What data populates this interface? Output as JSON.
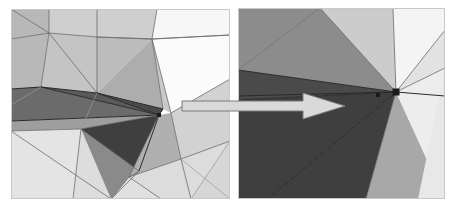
{
  "figure": {
    "caption": "",
    "background_color": "#ffffff",
    "width": 461,
    "height": 212
  },
  "panels": [
    {
      "id": "overview",
      "name": "overview-panel",
      "label": "",
      "x": 11,
      "y": 9,
      "width": 219,
      "height": 190,
      "background": "#ffffff"
    },
    {
      "id": "detail",
      "name": "detail-panel",
      "label": "",
      "x": 238,
      "y": 8,
      "width": 207,
      "height": 191,
      "background": "#ffffff"
    }
  ],
  "palette": {
    "very_dark": "#3f3f3f",
    "dark": "#4e4e4e",
    "mid_dark": "#8c8c8c",
    "mid": "#a3a3a3",
    "mid_light": "#b8b8b8",
    "light": "#cfcfcf",
    "lighter": "#dcdcdc",
    "lightest": "#e8e8e8",
    "near_white": "#f2f2f2",
    "white": "#ffffff",
    "edge": "#6b6b6b",
    "edge_dark": "#2a2a2a",
    "arrow_fill": "#d9d9d9",
    "arrow_stroke": "#7a7a7a",
    "vertex_marker": "#1a1a1a"
  },
  "arrow": {
    "name": "zoom-indicator-arrow",
    "description": "arrow pointing from overview panel to detail panel",
    "direction": "right",
    "tail_x": 182,
    "tip_x": 345,
    "center_y": 106,
    "shaft_half_height": 5,
    "head_half_height": 13,
    "head_length": 42,
    "fill": "#d9d9d9",
    "stroke": "#7a7a7a"
  },
  "mesh_overview": {
    "name": "triangulated-mesh-overview",
    "vertex_markers": [
      {
        "x": 148,
        "y": 106,
        "size": 4
      }
    ],
    "faces": [
      {
        "name": "face-tl-a",
        "points": "0,0 38,0 38,24 0,30",
        "fill": "#b8b8b8"
      },
      {
        "name": "face-tl-b",
        "points": "0,30 38,24 30,78 0,80",
        "fill": "#b8b8b8"
      },
      {
        "name": "face-tl-c",
        "points": "38,0 86,0 86,28 38,24",
        "fill": "#cfcfcf"
      },
      {
        "name": "face-tl-d",
        "points": "38,24 86,28 86,84 30,78",
        "fill": "#c4c4c4"
      },
      {
        "name": "face-tc-a",
        "points": "86,0 146,0 141,30 86,28",
        "fill": "#cfcfcf"
      },
      {
        "name": "face-tc-b",
        "points": "86,28 141,30 86,84",
        "fill": "#bcbcbc"
      },
      {
        "name": "face-tc-c",
        "points": "141,30 152,100 86,84",
        "fill": "#adadad"
      },
      {
        "name": "face-tr-a",
        "points": "146,0 219,0 219,26 141,30",
        "fill": "#f7f7f7"
      },
      {
        "name": "face-tr-b",
        "points": "141,30 219,26 219,70 160,104",
        "fill": "#fbfbfb"
      },
      {
        "name": "face-tr-c",
        "points": "141,30 160,104 152,100",
        "fill": "#c9c9c9"
      },
      {
        "name": "face-ml-a",
        "points": "0,80 30,78 10,96 0,96",
        "fill": "#a0a0a0"
      },
      {
        "name": "face-ml-b",
        "points": "0,80 10,96 0,96",
        "fill": "#8f8f8f"
      },
      {
        "name": "face-ml-c",
        "points": "0,80 30,78 148,106 0,112",
        "fill": "#6b6b6b"
      },
      {
        "name": "face-mc-a",
        "points": "30,78 86,84 148,106",
        "fill": "#5a5a5a"
      },
      {
        "name": "face-mc-b",
        "points": "86,84 152,100 148,106",
        "fill": "#4a4a4a"
      },
      {
        "name": "face-mc-c",
        "points": "0,112 148,106 70,120 0,122",
        "fill": "#9e9e9e"
      },
      {
        "name": "face-bl-a",
        "points": "0,122 70,120 62,190 0,190",
        "fill": "#e4e4e4"
      },
      {
        "name": "face-bl-b",
        "points": "70,120 100,190 62,190",
        "fill": "#dddddd"
      },
      {
        "name": "face-bc-a",
        "points": "70,120 148,106 118,168 100,190",
        "fill": "#8a8a8a"
      },
      {
        "name": "face-bc-b",
        "points": "148,106 128,162 118,168",
        "fill": "#4a4a4a"
      },
      {
        "name": "face-bc-c",
        "points": "70,120 148,106 128,162",
        "fill": "#3f3f3f"
      },
      {
        "name": "face-bc-d",
        "points": "100,190 118,168 150,190",
        "fill": "#e0e0e0"
      },
      {
        "name": "face-br-a",
        "points": "148,106 160,104 170,150 118,168",
        "fill": "#b0b0b0"
      },
      {
        "name": "face-br-b",
        "points": "118,168 170,150 180,190 150,190",
        "fill": "#dcdcdc"
      },
      {
        "name": "face-br-c",
        "points": "160,104 219,70 219,132 170,150",
        "fill": "#d2d2d2"
      },
      {
        "name": "face-br-d",
        "points": "170,150 219,132 219,190 180,190",
        "fill": "#dcdcdc"
      },
      {
        "name": "face-r-e",
        "points": "219,132 219,190 180,190",
        "fill": "#d6d6d6"
      }
    ],
    "edges": [
      {
        "name": "edge-top-curve",
        "d": "M 0,30 L 38,24 L 86,28 L 141,30 L 219,26",
        "class": "mesh-edge"
      },
      {
        "name": "edge-v1",
        "d": "M 38,0 L 38,24 L 30,78",
        "class": "mesh-edge"
      },
      {
        "name": "edge-v2",
        "d": "M 86,0 L 86,28 L 86,84",
        "class": "mesh-edge"
      },
      {
        "name": "edge-v3",
        "d": "M 146,0 L 141,30 L 152,100",
        "class": "mesh-edge"
      },
      {
        "name": "edge-d1",
        "d": "M 0,0 L 38,24",
        "class": "mesh-edge"
      },
      {
        "name": "edge-d2",
        "d": "M 38,24 L 86,84",
        "class": "mesh-edge"
      },
      {
        "name": "edge-d3",
        "d": "M 86,28 L 141,30",
        "class": "mesh-edge"
      },
      {
        "name": "edge-d4",
        "d": "M 141,30 L 160,104",
        "class": "mesh-edge"
      },
      {
        "name": "edge-d5",
        "d": "M 219,26 L 141,30",
        "class": "mesh-edge"
      },
      {
        "name": "edge-d6",
        "d": "M 219,70 L 160,104",
        "class": "mesh-edge"
      },
      {
        "name": "edge-h1",
        "d": "M 0,80 L 30,78 L 86,84 L 152,100 L 148,106",
        "class": "mesh-edge-dark"
      },
      {
        "name": "edge-h2",
        "d": "M 0,112 L 148,106",
        "class": "mesh-edge-dark"
      },
      {
        "name": "edge-h3",
        "d": "M 0,122 L 70,120 L 148,106",
        "class": "mesh-edge"
      },
      {
        "name": "edge-f1",
        "d": "M 30,78 L 148,106",
        "class": "mesh-edge-dark"
      },
      {
        "name": "edge-f2",
        "d": "M 86,84 L 148,106",
        "class": "mesh-edge-dark"
      },
      {
        "name": "edge-b1",
        "d": "M 70,120 L 128,162 L 118,168 L 100,190",
        "class": "mesh-edge"
      },
      {
        "name": "edge-b2",
        "d": "M 148,106 L 128,162",
        "class": "mesh-edge-dark"
      },
      {
        "name": "edge-b3",
        "d": "M 148,106 L 118,168",
        "class": "mesh-edge"
      },
      {
        "name": "edge-b4",
        "d": "M 118,168 L 150,190",
        "class": "mesh-edge"
      },
      {
        "name": "edge-b5",
        "d": "M 118,168 L 170,150",
        "class": "mesh-edge"
      },
      {
        "name": "edge-b6",
        "d": "M 160,104 L 170,150",
        "class": "mesh-edge"
      },
      {
        "name": "edge-b7",
        "d": "M 170,150 L 180,190",
        "class": "mesh-edge"
      },
      {
        "name": "edge-b8",
        "d": "M 170,150 L 219,132",
        "class": "mesh-edge"
      },
      {
        "name": "edge-b9",
        "d": "M 219,190 L 170,150",
        "class": "mesh-edge-faint"
      },
      {
        "name": "edge-b10",
        "d": "M 62,190 L 70,120",
        "class": "mesh-edge"
      },
      {
        "name": "edge-b11",
        "d": "M 0,122 L 100,190",
        "class": "mesh-edge"
      },
      {
        "name": "edge-b12",
        "d": "M 100,190 L 128,162",
        "class": "mesh-edge"
      },
      {
        "name": "edge-b13",
        "d": "M 86,84 L 70,120",
        "class": "mesh-edge-faint"
      },
      {
        "name": "edge-b14",
        "d": "M 0,96 L 30,78",
        "class": "mesh-edge-faint"
      },
      {
        "name": "edge-r1",
        "d": "M 219,132 L 180,190",
        "class": "mesh-edge-faint"
      }
    ]
  },
  "mesh_detail": {
    "name": "triangulated-mesh-detail",
    "vertex_markers": [
      {
        "x": 158,
        "y": 84,
        "size": 7
      },
      {
        "x": 140,
        "y": 87,
        "size": 4
      }
    ],
    "faces": [
      {
        "name": "d-face-upper-left",
        "points": "0,0 82,0 0,62",
        "fill": "#8c8c8c"
      },
      {
        "name": "d-face-upper-wedge",
        "points": "82,0 155,0 158,84 0,62",
        "fill": "#8c8c8c"
      },
      {
        "name": "d-face-upper-light",
        "points": "82,0 155,0 158,84",
        "fill": "#cccccc"
      },
      {
        "name": "d-face-top-right",
        "points": "155,0 207,0 207,22 158,84",
        "fill": "#f4f4f4"
      },
      {
        "name": "d-face-right-wedge-a",
        "points": "207,22 207,60 158,84",
        "fill": "#e2e2e2"
      },
      {
        "name": "d-face-band",
        "points": "0,62 158,84 0,92",
        "fill": "#4a4a4a"
      },
      {
        "name": "d-face-lower-left",
        "points": "0,92 158,84 30,191 0,191",
        "fill": "#3f3f3f"
      },
      {
        "name": "d-face-lower-mid",
        "points": "30,191 158,84 128,191",
        "fill": "#3f3f3f"
      },
      {
        "name": "d-face-lower-cone",
        "points": "158,84 128,191 207,191",
        "fill": "#a8a8a8"
      },
      {
        "name": "d-face-right-lower",
        "points": "158,84 207,60 207,191",
        "fill": "#ededed"
      },
      {
        "name": "d-face-right-strip",
        "points": "207,60 207,191 180,191",
        "fill": "#e8e8e8"
      }
    ],
    "edges": [
      {
        "name": "d-edge-1",
        "d": "M 0,0 L 0,62",
        "class": "mesh-edge-faint"
      },
      {
        "name": "d-edge-2",
        "d": "M 82,0 L 0,62",
        "class": "mesh-edge"
      },
      {
        "name": "d-edge-3",
        "d": "M 155,0 L 158,84",
        "class": "mesh-edge"
      },
      {
        "name": "d-edge-4",
        "d": "M 82,0 L 158,84",
        "class": "mesh-edge"
      },
      {
        "name": "d-edge-5",
        "d": "M 0,62 L 158,84",
        "class": "mesh-edge-dark"
      },
      {
        "name": "d-edge-6",
        "d": "M 0,92 L 158,84",
        "class": "mesh-edge-dark"
      },
      {
        "name": "d-edge-7",
        "d": "M 30,191 L 158,84",
        "class": "mesh-edge-dark"
      },
      {
        "name": "d-edge-8",
        "d": "M 128,191 L 158,84",
        "class": "mesh-edge"
      },
      {
        "name": "d-edge-9",
        "d": "M 158,84 L 207,22",
        "class": "mesh-edge"
      },
      {
        "name": "d-edge-10",
        "d": "M 158,84 L 207,60",
        "class": "mesh-edge"
      },
      {
        "name": "d-edge-11",
        "d": "M 158,84 L 207,88",
        "class": "mesh-edge-dark"
      },
      {
        "name": "d-edge-12",
        "d": "M 0,88 L 158,84",
        "class": "mesh-edge-dark"
      },
      {
        "name": "d-edge-13",
        "d": "M 155,0 L 207,0",
        "class": "mesh-edge-faint"
      }
    ]
  }
}
